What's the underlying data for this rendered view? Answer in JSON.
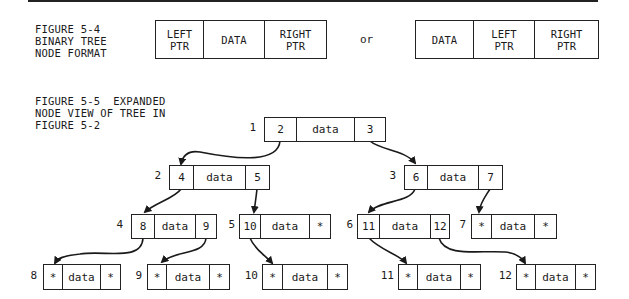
{
  "figure_5_4": {
    "caption": "FIGURE 5-4\nBINARY TREE\nNODE FORMAT",
    "format_a": [
      "LEFT\nPTR",
      "DATA",
      "RIGHT\nPTR"
    ],
    "or_label": "or",
    "format_b": [
      "DATA",
      "LEFT\nPTR",
      "RIGHT\nPTR"
    ]
  },
  "figure_5_5": {
    "caption": "FIGURE 5-5  EXPANDED\nNODE VIEW OF TREE IN\nFIGURE 5-2",
    "nodes": [
      {
        "id": "1",
        "left": "2",
        "data": "data",
        "right": "3"
      },
      {
        "id": "2",
        "left": "4",
        "data": "data",
        "right": "5"
      },
      {
        "id": "3",
        "left": "6",
        "data": "data",
        "right": "7"
      },
      {
        "id": "4",
        "left": "8",
        "data": "data",
        "right": "9"
      },
      {
        "id": "5",
        "left": "10",
        "data": "data",
        "right": "*"
      },
      {
        "id": "6",
        "left": "11",
        "data": "data",
        "right": "12"
      },
      {
        "id": "7",
        "left": "*",
        "data": "data",
        "right": "*"
      },
      {
        "id": "8",
        "left": "*",
        "data": "data",
        "right": "*"
      },
      {
        "id": "9",
        "left": "*",
        "data": "data",
        "right": "*"
      },
      {
        "id": "10",
        "left": "*",
        "data": "data",
        "right": "*"
      },
      {
        "id": "11",
        "left": "*",
        "data": "data",
        "right": "*"
      },
      {
        "id": "12",
        "left": "*",
        "data": "data",
        "right": "*"
      }
    ],
    "edges": [
      {
        "from": "1",
        "to": "2"
      },
      {
        "from": "1",
        "to": "3"
      },
      {
        "from": "2",
        "to": "4"
      },
      {
        "from": "2",
        "to": "5"
      },
      {
        "from": "3",
        "to": "6"
      },
      {
        "from": "3",
        "to": "7"
      },
      {
        "from": "4",
        "to": "8"
      },
      {
        "from": "4",
        "to": "9"
      },
      {
        "from": "5",
        "to": "10"
      },
      {
        "from": "6",
        "to": "11"
      },
      {
        "from": "6",
        "to": "12"
      }
    ]
  }
}
